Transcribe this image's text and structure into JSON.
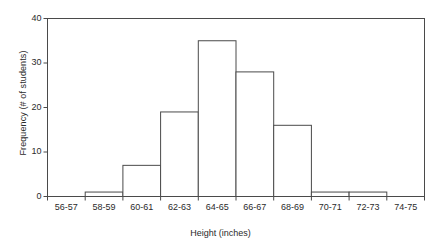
{
  "chart_data": {
    "type": "bar",
    "title": "",
    "subtitle": "",
    "xlabel": "Height (inches)",
    "ylabel": "Frequency (# of students)",
    "categories": [
      "56-57",
      "58-59",
      "60-61",
      "62-63",
      "64-65",
      "66-67",
      "68-69",
      "70-71",
      "72-73",
      "74-75"
    ],
    "values": [
      0,
      1,
      7,
      19,
      35,
      28,
      16,
      1,
      1,
      0
    ],
    "ylim": [
      0,
      40
    ],
    "yticks": [
      0,
      10,
      20,
      30,
      40
    ],
    "ytick_labels": [
      "0",
      "10",
      "20",
      "30",
      "40"
    ],
    "grid": false,
    "legend": null,
    "bar_fill_color": "#ffffff",
    "bar_edge_color": "#4a4a4a",
    "axis_color": "#4a4a4a",
    "background_color": "#ffffff",
    "annotations": []
  },
  "axes": {
    "y_title": "Frequency (# of students)",
    "x_title": "Height (inches)"
  }
}
